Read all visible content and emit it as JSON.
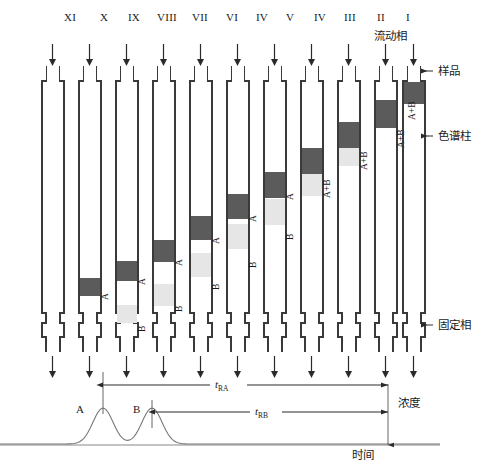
{
  "diagram": {
    "title_columns": [
      "XI",
      "X",
      "IX",
      "VIII",
      "VII",
      "VI",
      "IV",
      "V",
      "IV",
      "III",
      "II",
      "I"
    ],
    "column_labels": [
      {
        "id": "col-11",
        "text": "XI",
        "x": 70
      },
      {
        "id": "col-10",
        "text": "X",
        "x": 104
      },
      {
        "id": "col-9",
        "text": "IX",
        "x": 134
      },
      {
        "id": "col-8",
        "text": "VIII",
        "x": 167
      },
      {
        "id": "col-7",
        "text": "VII",
        "x": 200
      },
      {
        "id": "col-6",
        "text": "VI",
        "x": 232
      },
      {
        "id": "col-5",
        "text": "IV",
        "x": 262
      },
      {
        "id": "col-4",
        "text": "V",
        "x": 290
      },
      {
        "id": "col-3",
        "text": "IV",
        "x": 320
      },
      {
        "id": "col-2",
        "text": "III",
        "x": 350
      },
      {
        "id": "col-1",
        "text": "II",
        "x": 381
      },
      {
        "id": "col-0",
        "text": "I",
        "x": 408
      }
    ],
    "mobile_phase_label": "流动相",
    "callouts": {
      "sample": "样品",
      "column": "色谱柱",
      "stationary_phase": "固定相",
      "concentration": "浓度"
    },
    "band_tags": {
      "a": "A",
      "b": "B",
      "ab": "A+B"
    },
    "columns": [
      {
        "name": "column-11",
        "x": 52,
        "bands": []
      },
      {
        "name": "column-10",
        "x": 89,
        "bands": [
          {
            "kind": "a",
            "top": 278,
            "height": 18,
            "tag": "A",
            "tag_x": 101,
            "tag_y": 300
          }
        ]
      },
      {
        "name": "column-9",
        "x": 126,
        "bands": [
          {
            "kind": "a",
            "top": 261,
            "height": 20,
            "tag": "A",
            "tag_x": 138,
            "tag_y": 285
          },
          {
            "kind": "b",
            "top": 305,
            "height": 18,
            "tag": "B",
            "tag_x": 138,
            "tag_y": 332
          }
        ]
      },
      {
        "name": "column-8",
        "x": 163,
        "bands": [
          {
            "kind": "a",
            "top": 240,
            "height": 22,
            "tag": "A",
            "tag_x": 175,
            "tag_y": 266
          },
          {
            "kind": "b",
            "top": 284,
            "height": 22,
            "tag": "B",
            "tag_x": 175,
            "tag_y": 312
          }
        ]
      },
      {
        "name": "column-7",
        "x": 200,
        "bands": [
          {
            "kind": "a",
            "top": 216,
            "height": 24,
            "tag": "A",
            "tag_x": 212,
            "tag_y": 244
          },
          {
            "kind": "b",
            "top": 253,
            "height": 24,
            "tag": "B",
            "tag_x": 212,
            "tag_y": 290
          }
        ]
      },
      {
        "name": "column-6",
        "x": 237,
        "bands": [
          {
            "kind": "a",
            "top": 194,
            "height": 25,
            "tag": "A",
            "tag_x": 249,
            "tag_y": 222
          },
          {
            "kind": "b",
            "top": 224,
            "height": 25,
            "tag": "B",
            "tag_x": 249,
            "tag_y": 268
          }
        ]
      },
      {
        "name": "column-5",
        "x": 274,
        "bands": [
          {
            "kind": "a",
            "top": 172,
            "height": 26,
            "tag": "A",
            "tag_x": 286,
            "tag_y": 200
          },
          {
            "kind": "b",
            "top": 199,
            "height": 26,
            "tag": "B",
            "tag_x": 286,
            "tag_y": 240
          }
        ]
      },
      {
        "name": "column-4",
        "x": 311,
        "bands": [
          {
            "kind": "ab_dark",
            "top": 148,
            "height": 26
          },
          {
            "kind": "ab_light",
            "top": 174,
            "height": 22,
            "tag": "A+B",
            "tag_x": 323,
            "tag_y": 198
          }
        ]
      },
      {
        "name": "column-3",
        "x": 348,
        "bands": [
          {
            "kind": "ab_dark",
            "top": 122,
            "height": 26
          },
          {
            "kind": "ab_light",
            "top": 148,
            "height": 18,
            "tag": "A+B",
            "tag_x": 360,
            "tag_y": 170
          }
        ]
      },
      {
        "name": "column-2",
        "x": 385,
        "bands": [
          {
            "kind": "ab_dark",
            "top": 100,
            "height": 28,
            "tag": "A+B",
            "tag_x": 397,
            "tag_y": 148
          }
        ]
      },
      {
        "name": "column-1",
        "x": 413,
        "bands": [
          {
            "kind": "ab_dark",
            "top": 82,
            "height": 22,
            "tag": "A+B",
            "tag_x": 408,
            "tag_y": 120
          }
        ]
      }
    ]
  },
  "chart_data": {
    "type": "line",
    "title": "",
    "xlabel": "时间",
    "ylabel": "浓度",
    "series": [
      {
        "name": "chromatogram-baseline-trace",
        "peaks": [
          {
            "label": "A",
            "center_x": 103,
            "height": 36,
            "width": 26,
            "retention_label": "tRA"
          },
          {
            "label": "B",
            "center_x": 152,
            "height": 36,
            "width": 26,
            "retention_label": "tRB"
          }
        ]
      }
    ],
    "annotations": [
      {
        "name": "retention-time-a",
        "label": "t",
        "sub": "RA",
        "from_x": 103,
        "to_x": 388,
        "y": 385
      },
      {
        "name": "retention-time-b",
        "label": "t",
        "sub": "RB",
        "from_x": 155,
        "to_x": 388,
        "y": 412
      }
    ],
    "axis_labels": {
      "concentration": "浓度",
      "time": "时间"
    },
    "grid": false,
    "legend": "none"
  },
  "colors": {
    "band_a": "#5b5b5b",
    "band_b": "#e6e6e6",
    "outline": "#3a3a3a",
    "trace": "#666666",
    "arrow": "#2a2a2a"
  }
}
